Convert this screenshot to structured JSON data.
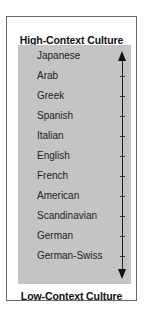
{
  "diagram": {
    "top_label": "High-Context Culture",
    "bottom_label": "Low-Context Culture",
    "items": [
      {
        "label": "Japanese"
      },
      {
        "label": "Arab"
      },
      {
        "label": "Greek"
      },
      {
        "label": "Spanish"
      },
      {
        "label": "Italian"
      },
      {
        "label": "English"
      },
      {
        "label": "French"
      },
      {
        "label": "American"
      },
      {
        "label": "Scandinavian"
      },
      {
        "label": "German"
      },
      {
        "label": "German-Swiss"
      }
    ],
    "axis": {
      "direction": "bidirectional-vertical",
      "arrow_up_icon": "arrow-up-icon",
      "arrow_down_icon": "arrow-down-icon"
    },
    "colors": {
      "panel": "#c4c4c4",
      "border": "#6a6a6a",
      "text": "#111111"
    }
  }
}
